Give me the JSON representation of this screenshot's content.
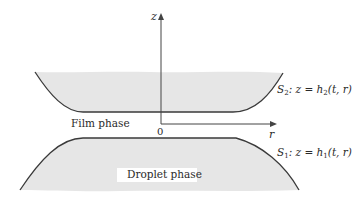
{
  "diagram": {
    "axes": {
      "z_label": "z",
      "r_label": "r",
      "origin_label": "0"
    },
    "surfaces": {
      "upper": {
        "name": "S",
        "index": "2",
        "eq_prefix": ": z = h",
        "eq_index": "2",
        "eq_args": "(t, r)"
      },
      "lower": {
        "name": "S",
        "index": "1",
        "eq_prefix": ": z = h",
        "eq_index": "1",
        "eq_args": "(t, r)"
      }
    },
    "regions": {
      "film": "Film phase",
      "droplet": "Droplet phase"
    },
    "colors": {
      "fill": "#e6e6e6",
      "stroke": "#3a3a3a",
      "axis": "#444444"
    }
  }
}
